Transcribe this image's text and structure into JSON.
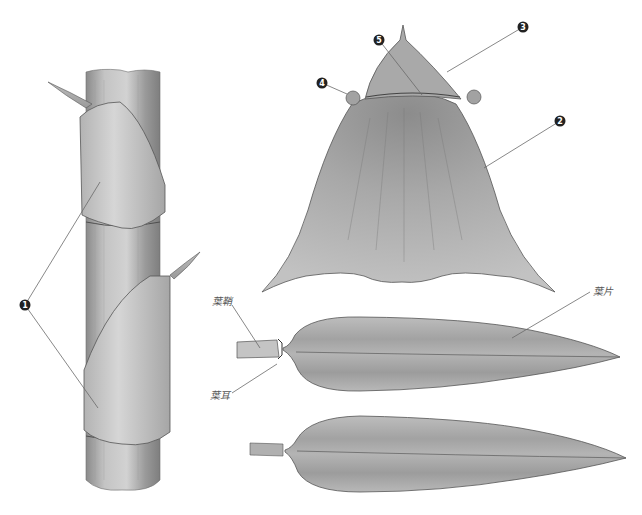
{
  "figure": {
    "colors": {
      "background": "#ffffff",
      "stem_fill": "#b9b9b9",
      "stem_dark": "#8e8e8e",
      "sheath_fill": "#c8c8c8",
      "leaf_fill": "#aeaeae",
      "outline": "#555555",
      "leader_line": "#777777",
      "marker_fill": "#222222",
      "marker_text": "#ffffff"
    }
  },
  "markers": [
    {
      "id": "1",
      "glyph": "1",
      "meaning": "culm sheath",
      "x": 25,
      "y": 305
    },
    {
      "id": "2",
      "glyph": "2",
      "meaning": "sheath body",
      "x": 560,
      "y": 121
    },
    {
      "id": "3",
      "glyph": "3",
      "meaning": "sheath blade",
      "x": 523,
      "y": 27
    },
    {
      "id": "4",
      "glyph": "4",
      "meaning": "sheath auricle",
      "x": 322,
      "y": 83
    },
    {
      "id": "5",
      "glyph": "5",
      "meaning": "ligule",
      "x": 379,
      "y": 40
    }
  ],
  "labels": {
    "leaf_sheath": "葉鞘",
    "leaf_auricle": "葉耳",
    "leaf_blade": "葉片"
  }
}
